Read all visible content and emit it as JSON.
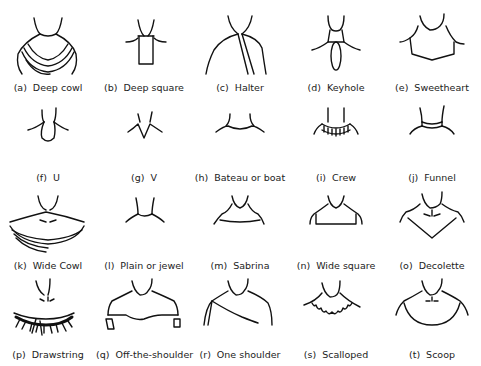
{
  "items": [
    {
      "tag": "(a)",
      "name": "Deep cowl"
    },
    {
      "tag": "(b)",
      "name": "Deep square"
    },
    {
      "tag": "(c)",
      "name": "Halter"
    },
    {
      "tag": "(d)",
      "name": "Keyhole"
    },
    {
      "tag": "(e)",
      "name": "Sweetheart"
    },
    {
      "tag": "(f)",
      "name": "U"
    },
    {
      "tag": "(g)",
      "name": "V"
    },
    {
      "tag": "(h)",
      "name": "Bateau or boat"
    },
    {
      "tag": "(i)",
      "name": "Crew"
    },
    {
      "tag": "(j)",
      "name": "Funnel"
    },
    {
      "tag": "(k)",
      "name": "Wide Cowl"
    },
    {
      "tag": "(l)",
      "name": "Plain or jewel"
    },
    {
      "tag": "(m)",
      "name": "Sabrina"
    },
    {
      "tag": "(n)",
      "name": "Wide square"
    },
    {
      "tag": "(o)",
      "name": "Decolette"
    },
    {
      "tag": "(p)",
      "name": "Drawstring"
    },
    {
      "tag": "(q)",
      "name": "Off-the-shoulder"
    },
    {
      "tag": "(r)",
      "name": "One shoulder"
    },
    {
      "tag": "(s)",
      "name": "Scalloped"
    },
    {
      "tag": "(t)",
      "name": "Scoop"
    }
  ]
}
